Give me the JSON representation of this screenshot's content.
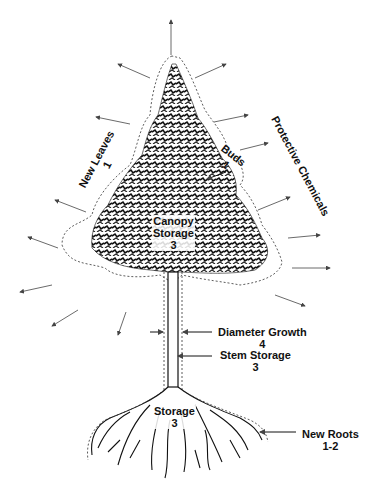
{
  "labels": {
    "new_leaves": {
      "name": "New Leaves",
      "priority": "1"
    },
    "buds": {
      "name": "Buds",
      "priority": "1"
    },
    "protective_chemicals": {
      "name": "Protective Chemicals"
    },
    "canopy_storage": {
      "name1": "Canopy",
      "name2": "Storage",
      "priority": "3"
    },
    "diameter_growth": {
      "name": "Diameter Growth",
      "priority": "4"
    },
    "stem_storage": {
      "name": "Stem Storage",
      "priority": "3"
    },
    "root_storage": {
      "name": "Storage",
      "priority": "3"
    },
    "new_roots": {
      "name": "New Roots",
      "priority": "1-2"
    }
  },
  "colors": {
    "ink": "#111111",
    "arrow": "#444444",
    "background": "#ffffff"
  }
}
